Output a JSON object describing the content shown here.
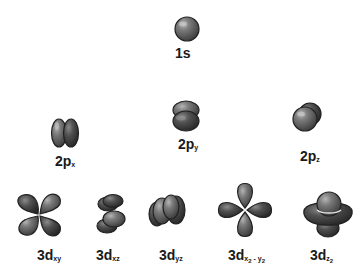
{
  "diagram": {
    "colors": {
      "lobe_dark": "#3d3d3d",
      "lobe_mid": "#6e6e6e",
      "lobe_light": "#9a9a9a",
      "outline": "#222222",
      "text": "#1a1a1a",
      "background": "#ffffff"
    },
    "orbitals": [
      {
        "id": "1s",
        "main": "1s",
        "sub": ""
      },
      {
        "id": "2px",
        "main": "2p",
        "sub": "x"
      },
      {
        "id": "2py",
        "main": "2p",
        "sub": "y"
      },
      {
        "id": "2pz",
        "main": "2p",
        "sub": "z"
      },
      {
        "id": "3dxy",
        "main": "3d",
        "sub": "xy"
      },
      {
        "id": "3dxz",
        "main": "3d",
        "sub": "xz"
      },
      {
        "id": "3dyz",
        "main": "3d",
        "sub": "yz"
      },
      {
        "id": "3dx2y2",
        "main": "3d",
        "sub_a": "x",
        "sub_a2": "2",
        "sub_sep": " - ",
        "sub_b": "y",
        "sub_b2": "2"
      },
      {
        "id": "3dz2",
        "main": "3d",
        "sub_a": "z",
        "sub_a2": "2"
      }
    ]
  }
}
